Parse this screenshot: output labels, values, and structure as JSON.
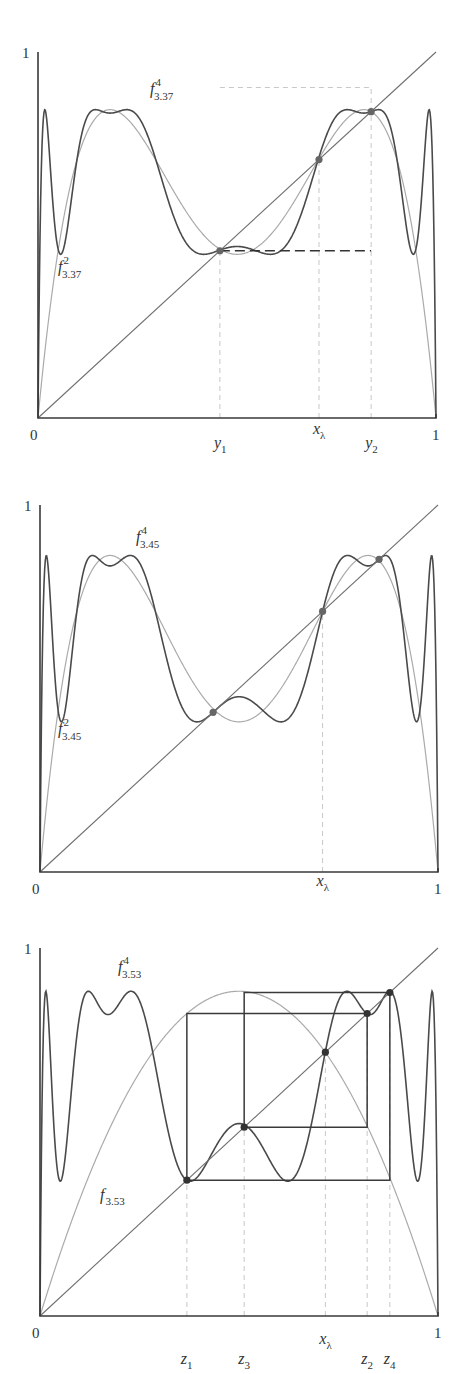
{
  "chart_data": [
    {
      "type": "line",
      "title": "",
      "xlabel": "",
      "ylabel": "",
      "xlim": [
        0,
        1
      ],
      "ylim": [
        0,
        1
      ],
      "grid": false,
      "lambda": 3.37,
      "tick_labels": {
        "x0": "0",
        "x1": "1",
        "y1": "1"
      },
      "series": [
        {
          "name": "f^2_{3.37}",
          "label_base": "f",
          "label_sup": "2",
          "label_sub": "3.37",
          "iterate": 2,
          "style": "light"
        },
        {
          "name": "f^4_{3.37}",
          "label_base": "f",
          "label_sup": "4",
          "label_sub": "3.37",
          "iterate": 4,
          "style": "dark"
        },
        {
          "name": "diagonal y=x",
          "style": "diag"
        }
      ],
      "marked_points": [
        {
          "label": "y",
          "sub": "1",
          "x": 0.457
        },
        {
          "label": "x",
          "sub": "λ",
          "x": 0.706
        },
        {
          "label": "y",
          "sub": "2",
          "x": 0.837
        }
      ],
      "dashed_segment": {
        "from_x": 0.457,
        "to_x": 0.837,
        "y": 0.457
      },
      "dots_x": [
        0.457,
        0.706,
        0.837
      ]
    },
    {
      "type": "line",
      "title": "",
      "xlabel": "",
      "ylabel": "",
      "xlim": [
        0,
        1
      ],
      "ylim": [
        0,
        1
      ],
      "grid": false,
      "lambda": 3.45,
      "tick_labels": {
        "x0": "0",
        "x1": "1",
        "y1": "1"
      },
      "series": [
        {
          "name": "f^2_{3.45}",
          "label_base": "f",
          "label_sup": "2",
          "label_sub": "3.45",
          "iterate": 2,
          "style": "light"
        },
        {
          "name": "f^4_{3.45}",
          "label_base": "f",
          "label_sup": "4",
          "label_sub": "3.45",
          "iterate": 4,
          "style": "dark"
        },
        {
          "name": "diagonal y=x",
          "style": "diag"
        }
      ],
      "marked_points": [
        {
          "label": "x",
          "sub": "λ",
          "x": 0.71
        }
      ],
      "dots_x": [
        0.435,
        0.71,
        0.852
      ]
    },
    {
      "type": "line",
      "title": "",
      "xlabel": "",
      "ylabel": "",
      "xlim": [
        0,
        1
      ],
      "ylim": [
        0,
        1
      ],
      "grid": false,
      "lambda": 3.53,
      "tick_labels": {
        "x0": "0",
        "x1": "1",
        "y1": "1"
      },
      "series": [
        {
          "name": "f_{3.53}",
          "label_base": "f",
          "label_sup": "",
          "label_sub": "3.53",
          "iterate": 1,
          "style": "light"
        },
        {
          "name": "f^4_{3.53}",
          "label_base": "f",
          "label_sup": "4",
          "label_sub": "3.53",
          "iterate": 4,
          "style": "dark"
        },
        {
          "name": "diagonal y=x",
          "style": "diag"
        }
      ],
      "marked_points": [
        {
          "label": "z",
          "sub": "1",
          "x": 0.369
        },
        {
          "label": "z",
          "sub": "3",
          "x": 0.513
        },
        {
          "label": "x",
          "sub": "λ",
          "x": 0.717
        },
        {
          "label": "z",
          "sub": "2",
          "x": 0.822
        },
        {
          "label": "z",
          "sub": "4",
          "x": 0.879
        }
      ],
      "cobweb_cycle": [
        "z1",
        "z2",
        "z3",
        "z4"
      ],
      "dots_x": [
        0.369,
        0.513,
        0.717,
        0.822,
        0.879
      ]
    }
  ],
  "colors": {
    "axis": "#3a3a3a",
    "light_curve": "#aaaaaa",
    "dark_curve": "#4a4a4a",
    "diagonal": "#6f6f6f",
    "guide": "#c8c8c8",
    "dot": "#666666"
  }
}
